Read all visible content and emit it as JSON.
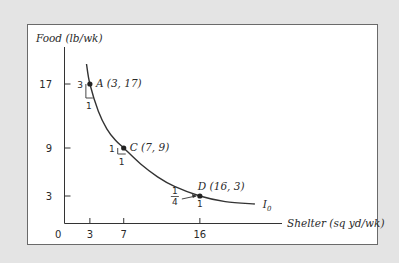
{
  "chart_data": {
    "type": "line",
    "title": "",
    "xlabel": "Shelter (sq yd/wk)",
    "ylabel": "Food (lb/wk)",
    "xlim": [
      0,
      25
    ],
    "ylim": [
      0,
      20
    ],
    "grid": false,
    "origin_label": "0",
    "x_ticks": [
      3,
      7,
      16
    ],
    "x_tick_labels": [
      "3",
      "7",
      "16"
    ],
    "y_ticks": [
      17,
      9,
      3
    ],
    "y_tick_labels": [
      "17",
      "9",
      "3"
    ],
    "series": [
      {
        "name": "I0",
        "label_main": "I",
        "label_sub": "0",
        "curve": [
          [
            2.6,
            19.5
          ],
          [
            3,
            17
          ],
          [
            4,
            13.6
          ],
          [
            5,
            11.4
          ],
          [
            6,
            10
          ],
          [
            7,
            9
          ],
          [
            9,
            7.0
          ],
          [
            11,
            5.4
          ],
          [
            13,
            4.2
          ],
          [
            16,
            3
          ],
          [
            19,
            2.3
          ],
          [
            22.5,
            2.0
          ]
        ]
      }
    ],
    "points": [
      {
        "id": "A",
        "label": "A (3, 17)",
        "x": 3,
        "y": 17,
        "rise": "3",
        "run": "1"
      },
      {
        "id": "C",
        "label": "C (7, 9)",
        "x": 7,
        "y": 9,
        "rise": "1",
        "run": "1"
      },
      {
        "id": "D",
        "label": "D (16, 3)",
        "x": 16,
        "y": 3,
        "rise_num": "1",
        "rise_den": "4",
        "run": "1"
      }
    ]
  }
}
